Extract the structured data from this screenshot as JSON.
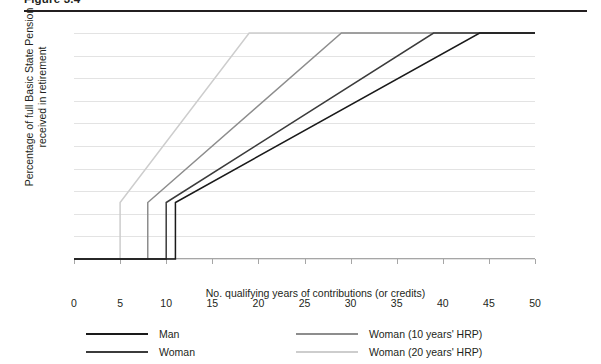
{
  "figure": {
    "heading": "Figure 3.4",
    "rule_color": "#231f20"
  },
  "chart_data": {
    "type": "line",
    "title": "",
    "xlabel": "No. qualifying years of contributions (or credits)",
    "ylabel": "Percentage of full Basic State Pension received in retirement",
    "xlim": [
      0,
      50
    ],
    "ylim": [
      0,
      100
    ],
    "xticks": [
      0,
      5,
      10,
      15,
      20,
      25,
      30,
      35,
      40,
      45,
      50
    ],
    "xtick_labels": [
      "0",
      "5",
      "10",
      "15",
      "20",
      "25",
      "30",
      "35",
      "40",
      "45",
      "50"
    ],
    "yticks": [
      0,
      10,
      20,
      30,
      40,
      50,
      60,
      70,
      80,
      90,
      100
    ],
    "ytick_labels": [
      "0%",
      "10%",
      "20%",
      "30%",
      "40%",
      "50%",
      "60%",
      "70%",
      "80%",
      "90%",
      "100%"
    ],
    "grid": "horizontal",
    "legend_position": "bottom",
    "series": [
      {
        "name": "Man",
        "color": "#1a1a1a",
        "points": [
          [
            0,
            0
          ],
          [
            11,
            0
          ],
          [
            11,
            25
          ],
          [
            44,
            100
          ],
          [
            50,
            100
          ]
        ]
      },
      {
        "name": "Woman",
        "color": "#3b3b3b",
        "points": [
          [
            0,
            0
          ],
          [
            10,
            0
          ],
          [
            10,
            25
          ],
          [
            39,
            100
          ],
          [
            50,
            100
          ]
        ]
      },
      {
        "name": "Woman (10 years' HRP)",
        "color": "#8d8d8d",
        "points": [
          [
            0,
            0
          ],
          [
            8,
            0
          ],
          [
            8,
            25
          ],
          [
            29,
            100
          ],
          [
            50,
            100
          ]
        ]
      },
      {
        "name": "Woman (20 years' HRP)",
        "color": "#cdcdcd",
        "points": [
          [
            0,
            0
          ],
          [
            5,
            0
          ],
          [
            5,
            25
          ],
          [
            19,
            100
          ],
          [
            50,
            100
          ]
        ]
      }
    ]
  },
  "legend": {
    "items": [
      {
        "label": "Man",
        "color": "#1a1a1a"
      },
      {
        "label": "Woman",
        "color": "#3b3b3b"
      },
      {
        "label": "Woman (10 years' HRP)",
        "color": "#8d8d8d"
      },
      {
        "label": "Woman (20 years' HRP)",
        "color": "#cdcdcd"
      }
    ]
  }
}
